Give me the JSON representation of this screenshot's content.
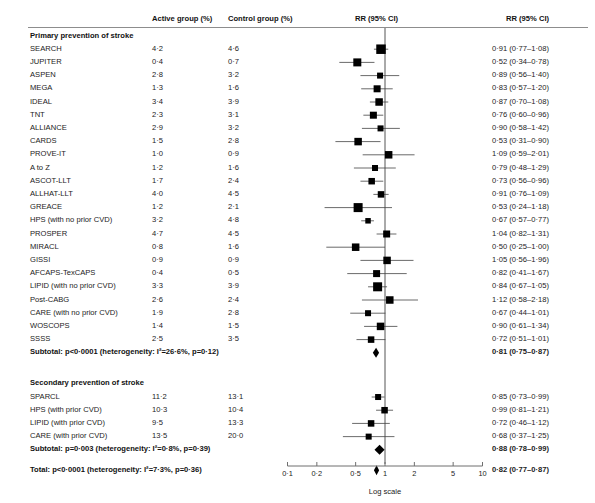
{
  "header": {
    "col_study": "",
    "col_active": "Active group (%)",
    "col_control": "Control group (%)",
    "col_plot": "RR (95% CI)",
    "col_rr": "RR (95% CI)"
  },
  "axis": {
    "title": "Log scale",
    "scale": "log",
    "ticks": [
      0.1,
      0.2,
      0.5,
      1,
      2,
      5,
      10
    ],
    "tick_labels": [
      "0·1",
      "0·2",
      "0·5",
      "1",
      "2",
      "5",
      "10"
    ],
    "null_value": 1,
    "xmin": 0.1,
    "xmax": 10
  },
  "groups": [
    {
      "label": "Primary prevention of stroke",
      "rows": [
        {
          "study": "SEARCH",
          "active": "4·2",
          "control": "4·6",
          "rr": "0·91 (0·77–1·08)",
          "est": 0.91,
          "lo": 0.77,
          "hi": 1.08,
          "size": 9.5
        },
        {
          "study": "JUPITER",
          "active": "0·4",
          "control": "0·7",
          "rr": "0·52 (0·34–0·78)",
          "est": 0.52,
          "lo": 0.34,
          "hi": 0.78,
          "size": 8.0
        },
        {
          "study": "ASPEN",
          "active": "2·8",
          "control": "3·2",
          "rr": "0·89 (0·56–1·40)",
          "est": 0.89,
          "lo": 0.56,
          "hi": 1.4,
          "size": 6.0
        },
        {
          "study": "MEGA",
          "active": "1·3",
          "control": "1·6",
          "rr": "0·83 (0·57–1·20)",
          "est": 0.83,
          "lo": 0.57,
          "hi": 1.2,
          "size": 7.0
        },
        {
          "study": "IDEAL",
          "active": "3·4",
          "control": "3·9",
          "rr": "0·87 (0·70–1·08)",
          "est": 0.87,
          "lo": 0.7,
          "hi": 1.08,
          "size": 7.5
        },
        {
          "study": "TNT",
          "active": "2·3",
          "control": "3·1",
          "rr": "0·76 (0·60–0·96)",
          "est": 0.76,
          "lo": 0.6,
          "hi": 0.96,
          "size": 7.0
        },
        {
          "study": "ALLIANCE",
          "active": "2·9",
          "control": "3·2",
          "rr": "0·90 (0·58–1·42)",
          "est": 0.9,
          "lo": 0.58,
          "hi": 1.42,
          "size": 6.0
        },
        {
          "study": "CARDS",
          "active": "1·5",
          "control": "2·8",
          "rr": "0·53 (0·31–0·90)",
          "est": 0.53,
          "lo": 0.31,
          "hi": 0.9,
          "size": 7.5
        },
        {
          "study": "PROVE-IT",
          "active": "1·0",
          "control": "0·9",
          "rr": "1·09 (0·59–2·01)",
          "est": 1.09,
          "lo": 0.59,
          "hi": 2.01,
          "size": 7.5
        },
        {
          "study": "A to Z",
          "active": "1·2",
          "control": "1·6",
          "rr": "0·79 (0·48–1·29)",
          "est": 0.79,
          "lo": 0.48,
          "hi": 1.29,
          "size": 6.0
        },
        {
          "study": "ASCOT-LLT",
          "active": "1·7",
          "control": "2·4",
          "rr": "0·73 (0·56–0·96)",
          "est": 0.73,
          "lo": 0.56,
          "hi": 0.96,
          "size": 6.5
        },
        {
          "study": "ALLHAT-LLT",
          "active": "4·0",
          "control": "4·5",
          "rr": "0·91 (0·76–1·09)",
          "est": 0.91,
          "lo": 0.76,
          "hi": 1.09,
          "size": 6.5
        },
        {
          "study": "GREACE",
          "active": "1·2",
          "control": "2·1",
          "rr": "0·53 (0·24–1·18)",
          "est": 0.53,
          "lo": 0.24,
          "hi": 1.18,
          "size": 9.0
        },
        {
          "study": "HPS (with no prior CVD)",
          "active": "3·2",
          "control": "4·8",
          "rr": "0·67 (0·57–0·77)",
          "est": 0.67,
          "lo": 0.57,
          "hi": 0.77,
          "size": 5.5
        },
        {
          "study": "PROSPER",
          "active": "4·7",
          "control": "4·5",
          "rr": "1·04 (0·82–1·31)",
          "est": 1.04,
          "lo": 0.82,
          "hi": 1.31,
          "size": 7.0
        },
        {
          "study": "MIRACL",
          "active": "0·8",
          "control": "1·6",
          "rr": "0·50 (0·25–1·00)",
          "est": 0.5,
          "lo": 0.25,
          "hi": 1.0,
          "size": 7.5
        },
        {
          "study": "GISSI",
          "active": "0·9",
          "control": "0·9",
          "rr": "1·05 (0·56–1·96)",
          "est": 1.05,
          "lo": 0.56,
          "hi": 1.96,
          "size": 7.5
        },
        {
          "study": "AFCAPS-TexCAPS",
          "active": "0·4",
          "control": "0·5",
          "rr": "0·82 (0·41–1·67)",
          "est": 0.82,
          "lo": 0.41,
          "hi": 1.67,
          "size": 7.0
        },
        {
          "study": "LIPID (with no prior CVD)",
          "active": "3·3",
          "control": "3·9",
          "rr": "0·84 (0·67–1·05)",
          "est": 0.84,
          "lo": 0.67,
          "hi": 1.05,
          "size": 9.0
        },
        {
          "study": "Post-CABG",
          "active": "2·6",
          "control": "2·4",
          "rr": "1·12 (0·58–2·18)",
          "est": 1.12,
          "lo": 0.58,
          "hi": 2.18,
          "size": 7.5
        },
        {
          "study": "CARE (with no prior CVD)",
          "active": "1·9",
          "control": "2·8",
          "rr": "0·67 (0·44–1·01)",
          "est": 0.67,
          "lo": 0.44,
          "hi": 1.01,
          "size": 6.0
        },
        {
          "study": "WOSCOPS",
          "active": "1·4",
          "control": "1·5",
          "rr": "0·90 (0·61–1·34)",
          "est": 0.9,
          "lo": 0.61,
          "hi": 1.34,
          "size": 7.5
        },
        {
          "study": "SSSS",
          "active": "2·5",
          "control": "3·5",
          "rr": "0·72 (0·51–1·01)",
          "est": 0.72,
          "lo": 0.51,
          "hi": 1.01,
          "size": 6.5
        }
      ],
      "subtotal": {
        "label": "Subtotal: p<0·0001 (heterogeneity: I²=26·6%, p=0·12)",
        "rr": "0·81 (0·75–0·87)",
        "est": 0.81,
        "lo": 0.75,
        "hi": 0.87
      }
    },
    {
      "label": "Secondary prevention of stroke",
      "rows": [
        {
          "study": "SPARCL",
          "active": "11·2",
          "control": "13·1",
          "rr": "0·85 (0·73–0·99)",
          "est": 0.85,
          "lo": 0.73,
          "hi": 0.99,
          "size": 6.0
        },
        {
          "study": "HPS (with prior CVD)",
          "active": "10·3",
          "control": "10·4",
          "rr": "0·99 (0·81–1·21)",
          "est": 0.99,
          "lo": 0.81,
          "hi": 1.21,
          "size": 6.5
        },
        {
          "study": "LIPID (with prior CVD)",
          "active": "9·5",
          "control": "13·3",
          "rr": "0·72 (0·46–1·12)",
          "est": 0.72,
          "lo": 0.46,
          "hi": 1.12,
          "size": 6.5
        },
        {
          "study": "CARE (with prior CVD)",
          "active": "13·5",
          "control": "20·0",
          "rr": "0·68 (0·37–1·25)",
          "est": 0.68,
          "lo": 0.37,
          "hi": 1.25,
          "size": 6.0
        }
      ],
      "subtotal": {
        "label": "Subtotal: p=0·003 (heterogeneity: I²=0·8%, p=0·39)",
        "rr": "0·88 (0·78–0·99)",
        "est": 0.88,
        "lo": 0.78,
        "hi": 0.99
      }
    }
  ],
  "total": {
    "label": "Total: p<0·0001 (heterogeneity: I²=7·3%, p=0·36)",
    "rr": "0·82 (0·77–0·87)",
    "est": 0.82,
    "lo": 0.77,
    "hi": 0.87
  },
  "chart_data": {
    "type": "scatter",
    "xlabel": "Log scale",
    "ylabel": "",
    "xscale": "log",
    "xlim": [
      0.1,
      10
    ],
    "xticks": [
      0.1,
      0.2,
      0.5,
      1,
      2,
      5,
      10
    ],
    "grid": false,
    "legend": "none",
    "reference_line": 1,
    "columns": [
      "Study",
      "Active group (%)",
      "Control group (%)",
      "RR (95% CI)"
    ],
    "series": [
      {
        "name": "Primary prevention of stroke",
        "points": [
          {
            "label": "SEARCH",
            "active": 4.2,
            "control": 4.6,
            "rr": 0.91,
            "ci_low": 0.77,
            "ci_high": 1.08
          },
          {
            "label": "JUPITER",
            "active": 0.4,
            "control": 0.7,
            "rr": 0.52,
            "ci_low": 0.34,
            "ci_high": 0.78
          },
          {
            "label": "ASPEN",
            "active": 2.8,
            "control": 3.2,
            "rr": 0.89,
            "ci_low": 0.56,
            "ci_high": 1.4
          },
          {
            "label": "MEGA",
            "active": 1.3,
            "control": 1.6,
            "rr": 0.83,
            "ci_low": 0.57,
            "ci_high": 1.2
          },
          {
            "label": "IDEAL",
            "active": 3.4,
            "control": 3.9,
            "rr": 0.87,
            "ci_low": 0.7,
            "ci_high": 1.08
          },
          {
            "label": "TNT",
            "active": 2.3,
            "control": 3.1,
            "rr": 0.76,
            "ci_low": 0.6,
            "ci_high": 0.96
          },
          {
            "label": "ALLIANCE",
            "active": 2.9,
            "control": 3.2,
            "rr": 0.9,
            "ci_low": 0.58,
            "ci_high": 1.42
          },
          {
            "label": "CARDS",
            "active": 1.5,
            "control": 2.8,
            "rr": 0.53,
            "ci_low": 0.31,
            "ci_high": 0.9
          },
          {
            "label": "PROVE-IT",
            "active": 1.0,
            "control": 0.9,
            "rr": 1.09,
            "ci_low": 0.59,
            "ci_high": 2.01
          },
          {
            "label": "A to Z",
            "active": 1.2,
            "control": 1.6,
            "rr": 0.79,
            "ci_low": 0.48,
            "ci_high": 1.29
          },
          {
            "label": "ASCOT-LLT",
            "active": 1.7,
            "control": 2.4,
            "rr": 0.73,
            "ci_low": 0.56,
            "ci_high": 0.96
          },
          {
            "label": "ALLHAT-LLT",
            "active": 4.0,
            "control": 4.5,
            "rr": 0.91,
            "ci_low": 0.76,
            "ci_high": 1.09
          },
          {
            "label": "GREACE",
            "active": 1.2,
            "control": 2.1,
            "rr": 0.53,
            "ci_low": 0.24,
            "ci_high": 1.18
          },
          {
            "label": "HPS (with no prior CVD)",
            "active": 3.2,
            "control": 4.8,
            "rr": 0.67,
            "ci_low": 0.57,
            "ci_high": 0.77
          },
          {
            "label": "PROSPER",
            "active": 4.7,
            "control": 4.5,
            "rr": 1.04,
            "ci_low": 0.82,
            "ci_high": 1.31
          },
          {
            "label": "MIRACL",
            "active": 0.8,
            "control": 1.6,
            "rr": 0.5,
            "ci_low": 0.25,
            "ci_high": 1.0
          },
          {
            "label": "GISSI",
            "active": 0.9,
            "control": 0.9,
            "rr": 1.05,
            "ci_low": 0.56,
            "ci_high": 1.96
          },
          {
            "label": "AFCAPS-TexCAPS",
            "active": 0.4,
            "control": 0.5,
            "rr": 0.82,
            "ci_low": 0.41,
            "ci_high": 1.67
          },
          {
            "label": "LIPID (with no prior CVD)",
            "active": 3.3,
            "control": 3.9,
            "rr": 0.84,
            "ci_low": 0.67,
            "ci_high": 1.05
          },
          {
            "label": "Post-CABG",
            "active": 2.6,
            "control": 2.4,
            "rr": 1.12,
            "ci_low": 0.58,
            "ci_high": 2.18
          },
          {
            "label": "CARE (with no prior CVD)",
            "active": 1.9,
            "control": 2.8,
            "rr": 0.67,
            "ci_low": 0.44,
            "ci_high": 1.01
          },
          {
            "label": "WOSCOPS",
            "active": 1.4,
            "control": 1.5,
            "rr": 0.9,
            "ci_low": 0.61,
            "ci_high": 1.34
          },
          {
            "label": "SSSS",
            "active": 2.5,
            "control": 3.5,
            "rr": 0.72,
            "ci_low": 0.51,
            "ci_high": 1.01
          }
        ],
        "pooled": {
          "label": "Subtotal",
          "rr": 0.81,
          "ci_low": 0.75,
          "ci_high": 0.87,
          "p": "<0.0001",
          "i2": "26.6%",
          "p_het": "0.12"
        }
      },
      {
        "name": "Secondary prevention of stroke",
        "points": [
          {
            "label": "SPARCL",
            "active": 11.2,
            "control": 13.1,
            "rr": 0.85,
            "ci_low": 0.73,
            "ci_high": 0.99
          },
          {
            "label": "HPS (with prior CVD)",
            "active": 10.3,
            "control": 10.4,
            "rr": 0.99,
            "ci_low": 0.81,
            "ci_high": 1.21
          },
          {
            "label": "LIPID (with prior CVD)",
            "active": 9.5,
            "control": 13.3,
            "rr": 0.72,
            "ci_low": 0.46,
            "ci_high": 1.12
          },
          {
            "label": "CARE (with prior CVD)",
            "active": 13.5,
            "control": 20.0,
            "rr": 0.68,
            "ci_low": 0.37,
            "ci_high": 1.25
          }
        ],
        "pooled": {
          "label": "Subtotal",
          "rr": 0.88,
          "ci_low": 0.78,
          "ci_high": 0.99,
          "p": "0.003",
          "i2": "0.8%",
          "p_het": "0.39"
        }
      }
    ],
    "overall": {
      "label": "Total",
      "rr": 0.82,
      "ci_low": 0.77,
      "ci_high": 0.87,
      "p": "<0.0001",
      "i2": "7.3%",
      "p_het": "0.36"
    }
  }
}
